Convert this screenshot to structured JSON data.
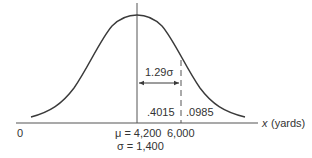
{
  "diagram": {
    "type": "normal-distribution",
    "colors": {
      "curve": "#3a3a3a",
      "axis": "#555555",
      "text": "#333333",
      "background": "#ffffff"
    },
    "axis": {
      "origin_label": "0",
      "x_var": "x",
      "x_unit": "(yards)"
    },
    "mean": {
      "label": "μ = 4,200",
      "value": 4200
    },
    "std_dev": {
      "label": "σ = 1,400",
      "value": 1400
    },
    "cutoff": {
      "label": "6,000",
      "value": 6000
    },
    "distance_annotation": {
      "label": "1.29σ"
    },
    "areas": {
      "between_mean_and_cutoff": ".4015",
      "right_tail": ".0985"
    }
  }
}
